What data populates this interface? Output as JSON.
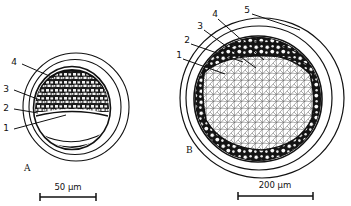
{
  "figure": {
    "type": "scientific-line-drawing",
    "background_color": "#ffffff",
    "ink_color": "#111111"
  },
  "panels": [
    {
      "id": "A",
      "letter": "A",
      "labels": [
        {
          "number": "4",
          "x": 14,
          "y": 62
        },
        {
          "number": "3",
          "x": 6,
          "y": 89
        },
        {
          "number": "2",
          "x": 6,
          "y": 108
        },
        {
          "number": "1",
          "x": 6,
          "y": 128
        }
      ],
      "scale_bar": {
        "value": "50",
        "unit": "µm",
        "label": "50  µm"
      }
    },
    {
      "id": "B",
      "letter": "B",
      "labels": [
        {
          "number": "5",
          "x": 245,
          "y": 12
        },
        {
          "number": "4",
          "x": 214,
          "y": 16
        },
        {
          "number": "3",
          "x": 199,
          "y": 27
        },
        {
          "number": "2",
          "x": 186,
          "y": 41
        },
        {
          "number": "1",
          "x": 178,
          "y": 56
        }
      ],
      "scale_bar": {
        "value": "200",
        "unit": "µm",
        "label": "200  µm"
      }
    }
  ]
}
